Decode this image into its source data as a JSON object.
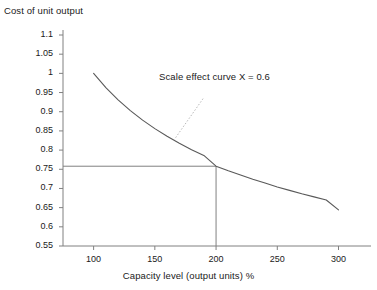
{
  "chart_data": {
    "type": "line",
    "title": "",
    "xlabel": "Capacity level (output units) %",
    "ylabel": "Cost of unit output",
    "xlim": [
      75,
      320
    ],
    "ylim": [
      0.55,
      1.1
    ],
    "grid": false,
    "legend": null,
    "xticks": [
      100,
      150,
      200,
      250,
      300
    ],
    "xtick_labels": [
      "100",
      "150",
      "200",
      "250",
      "300"
    ],
    "yticks": [
      0.55,
      0.6,
      0.65,
      0.7,
      0.75,
      0.8,
      0.85,
      0.9,
      0.95,
      1,
      1.05,
      1.1
    ],
    "ytick_labels": [
      "0.55",
      "0.6",
      "0.65",
      "0.7",
      "0.75",
      "0.8",
      "0.85",
      "0.9",
      "0.95",
      "1",
      "1.05",
      "1.1"
    ],
    "series": [
      {
        "name": "Scale effect curve X = 0.6",
        "x": [
          100,
          110,
          120,
          130,
          140,
          150,
          160,
          170,
          180,
          190,
          200,
          210,
          220,
          230,
          240,
          250,
          260,
          270,
          280,
          290,
          300
        ],
        "values": [
          1,
          0.963,
          0.931,
          0.903,
          0.878,
          0.856,
          0.836,
          0.818,
          0.801,
          0.786,
          0.758,
          0.746,
          0.735,
          0.724,
          0.714,
          0.704,
          0.695,
          0.686,
          0.678,
          0.67,
          0.644
        ]
      }
    ],
    "annotations": [
      {
        "text": "Scale effect curve X = 0.6",
        "x": 200,
        "y": 0.955,
        "leader_to_x": 166,
        "leader_to_y": 0.828,
        "style": "dotted-leader"
      }
    ],
    "reference_lines": [
      {
        "orientation": "horizontal",
        "value": 0.758,
        "from_x": 75,
        "to_x": 200
      },
      {
        "orientation": "vertical",
        "value": 200,
        "from_y": 0.55,
        "to_y": 0.758
      }
    ],
    "intersection_point": {
      "x": 200,
      "y": 0.758
    },
    "colors": {
      "curve": "#595959",
      "axis": "#808080",
      "reference_line": "#808080",
      "leader_line": "#b0b0b0",
      "text": "#1a1a1a",
      "background": "#ffffff"
    }
  }
}
